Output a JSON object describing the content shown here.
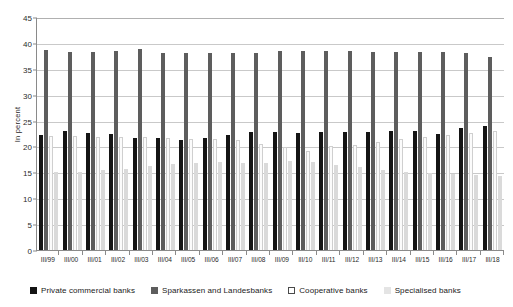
{
  "chart_data": {
    "type": "bar",
    "title": "",
    "xlabel": "",
    "ylabel": "In percent",
    "ylim": [
      0,
      45
    ],
    "ystep": 5,
    "yticks": [
      0,
      5,
      10,
      15,
      20,
      25,
      30,
      35,
      40,
      45
    ],
    "grid": true,
    "legend_position": "bottom",
    "categories": [
      "III/99",
      "III/00",
      "III/01",
      "III/02",
      "III/03",
      "III/04",
      "III/05",
      "III/06",
      "III/07",
      "III/08",
      "III/09",
      "III/10",
      "III/11",
      "III/12",
      "III/13",
      "III/14",
      "III/15",
      "III/16",
      "III/17",
      "III/18"
    ],
    "series": [
      {
        "name": "Private commercial banks",
        "color": "#141414",
        "values": [
          22.2,
          23.0,
          22.6,
          22.4,
          21.7,
          21.7,
          21.2,
          21.7,
          22.2,
          22.7,
          22.7,
          22.6,
          22.8,
          22.8,
          22.7,
          22.9,
          23.0,
          22.4,
          23.6,
          24.0
        ]
      },
      {
        "name": "Sparkassen and Landesbanks",
        "color": "#5d5d5d",
        "values": [
          38.7,
          38.2,
          38.2,
          38.4,
          38.8,
          38.1,
          38.1,
          38.0,
          38.0,
          38.1,
          38.4,
          38.5,
          38.5,
          38.4,
          38.3,
          38.3,
          38.2,
          38.2,
          38.0,
          37.3
        ]
      },
      {
        "name": "Cooperative banks",
        "color": "#fbfbfb",
        "values": [
          22.1,
          22.1,
          21.9,
          21.8,
          21.8,
          21.6,
          21.4,
          21.4,
          21.3,
          20.5,
          19.8,
          19.2,
          20.0,
          20.3,
          20.9,
          21.4,
          21.8,
          22.2,
          22.6,
          22.9
        ]
      },
      {
        "name": "Specialised banks",
        "color": "#dadada",
        "values": [
          15.0,
          15.0,
          15.4,
          15.7,
          16.2,
          16.6,
          16.9,
          17.0,
          16.8,
          16.8,
          17.1,
          17.0,
          16.4,
          16.0,
          15.5,
          15.1,
          14.8,
          14.6,
          14.4,
          14.2
        ]
      }
    ]
  },
  "legend": {
    "items": [
      {
        "label": "Private commercial banks"
      },
      {
        "label": "Sparkassen and Landesbanks"
      },
      {
        "label": "Cooperative banks"
      },
      {
        "label": "Specialised banks"
      }
    ]
  }
}
